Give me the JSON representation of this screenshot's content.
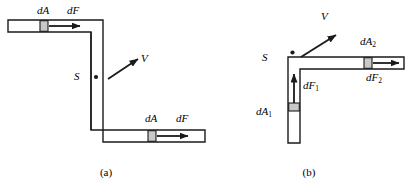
{
  "figure": {
    "background_color": "#ffffff",
    "stroke_color": "#1a1a1a",
    "band_fill_color": "#c8c8c8",
    "width": 413,
    "height": 191
  },
  "panels": [
    {
      "id": "a",
      "caption": "(a)",
      "caption_x": 102,
      "caption_y": 168,
      "description": "Z-shaped tube: upper-left horizontal arm, vertical middle section, lower-right horizontal arm",
      "labels": {
        "dA_upper": "dA",
        "dF_upper": "dF",
        "dA_lower": "dA",
        "dF_lower": "dF",
        "velocity": "V",
        "surface": "S"
      },
      "label_positions": {
        "dA_upper": {
          "x": 37,
          "y": 6
        },
        "dF_upper": {
          "x": 67,
          "y": 6
        },
        "dA_lower": {
          "x": 145,
          "y": 113
        },
        "dF_lower": {
          "x": 176,
          "y": 113
        },
        "velocity": {
          "x": 142,
          "y": 57
        },
        "surface": {
          "x": 74,
          "y": 70
        }
      },
      "geometry": {
        "tube_thickness": 12,
        "upper_arm": {
          "x1": 8,
          "y1": 20,
          "x2": 103,
          "y2": 32
        },
        "vertical_arm": {
          "x1": 91,
          "y1": 20,
          "x2": 103,
          "y2": 142
        },
        "lower_arm": {
          "x1": 91,
          "y1": 130,
          "x2": 205,
          "y2": 142
        },
        "band_upper_x": 40,
        "band_lower_x": 148,
        "band_width": 8,
        "arrow_upper": {
          "x1": 49,
          "y1": 26,
          "x2": 80,
          "y2": 26
        },
        "arrow_lower": {
          "x1": 157,
          "y1": 136,
          "x2": 188,
          "y2": 136
        },
        "velocity_arrow": {
          "x1": 108,
          "y1": 79,
          "x2": 139,
          "y2": 58
        },
        "surface_dot": {
          "x": 96,
          "y": 77,
          "r": 2
        }
      }
    },
    {
      "id": "b",
      "caption": "(b)",
      "caption_x": 305,
      "caption_y": 168,
      "description": "L-shaped tube: vertical lower arm turning into right horizontal arm",
      "labels": {
        "dA_1": "dA",
        "dA_1_sub": "1",
        "dF_1": "dF",
        "dF_1_sub": "1",
        "dA_2": "dA",
        "dA_2_sub": "2",
        "dF_2": "dF",
        "dF_2_sub": "2",
        "velocity": "V",
        "surface": "S"
      },
      "label_positions": {
        "dA_1": {
          "x": 258,
          "y": 106
        },
        "dF_1": {
          "x": 304,
          "y": 80
        },
        "dA_2": {
          "x": 362,
          "y": 37
        },
        "dF_2": {
          "x": 368,
          "y": 72
        },
        "velocity": {
          "x": 322,
          "y": 14
        },
        "surface": {
          "x": 263,
          "y": 52
        }
      },
      "geometry": {
        "tube_thickness": 12,
        "vertical_arm": {
          "x1": 288,
          "y1": 57,
          "x2": 300,
          "y2": 143
        },
        "horizontal_arm": {
          "x1": 288,
          "y1": 57,
          "x2": 404,
          "y2": 69
        },
        "band_vertical_y": 103,
        "band_horizontal_x": 364,
        "band_width": 8,
        "arrow_vertical": {
          "x1": 294,
          "y1": 103,
          "x2": 294,
          "y2": 73
        },
        "arrow_horizontal": {
          "x1": 373,
          "y1": 63,
          "x2": 399,
          "y2": 63
        },
        "velocity_arrow": {
          "x1": 301,
          "y1": 57,
          "x2": 337,
          "y2": 34
        },
        "surface_dot": {
          "x": 292,
          "y": 53,
          "r": 2
        }
      }
    }
  ]
}
